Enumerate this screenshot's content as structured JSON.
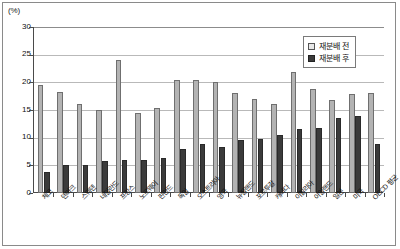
{
  "chart_data": {
    "type": "bar",
    "title": "",
    "subtitle": "",
    "xlabel": "",
    "ylabel": "(%)",
    "unit_label": "(%)",
    "ylim": [
      0,
      30
    ],
    "ytick_step": 5,
    "yticks": [
      "0",
      "5",
      "10",
      "15",
      "20",
      "25",
      "30"
    ],
    "grid": true,
    "legend_position": "top-right",
    "categories": [
      "체코",
      "덴마크",
      "스웨덴",
      "네덜란드",
      "프랑스",
      "노르웨이",
      "핀란드",
      "독일",
      "오스트리아",
      "영국",
      "뉴질랜드",
      "포르투갈",
      "캐나다",
      "이탈리아",
      "아일랜드",
      "일본",
      "미국",
      "OECD 평균"
    ],
    "series": [
      {
        "name": "재분배 전",
        "color": "#b3b3b3",
        "values": [
          19.6,
          18.3,
          16.1,
          15.0,
          24.1,
          14.4,
          15.3,
          20.4,
          20.5,
          20.0,
          18.1,
          17.0,
          16.0,
          21.8,
          18.8,
          16.9,
          17.9,
          18.0
        ]
      },
      {
        "name": "재분배 후",
        "color": "#3b3b3b",
        "values": [
          3.8,
          5.1,
          5.0,
          5.8,
          6.0,
          6.0,
          6.4,
          8.0,
          8.8,
          8.3,
          9.6,
          9.7,
          10.4,
          11.6,
          11.8,
          13.6,
          13.9,
          8.9
        ]
      }
    ]
  },
  "legend": {
    "items": [
      {
        "label": "재분배 전",
        "swatch": "light-gray-square"
      },
      {
        "label": "재분배 후",
        "swatch": "dark-gray-square"
      }
    ]
  }
}
